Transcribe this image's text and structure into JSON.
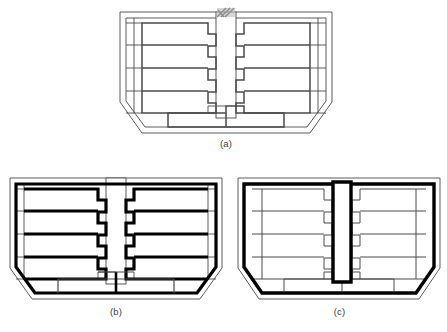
{
  "figure": {
    "kind": "architectural-floor-plan-diagram-set",
    "panel_count": 3,
    "background_color": "#ffffff",
    "line_color_thin": "#4a4a4a",
    "line_color_thick": "#000000",
    "accent_gray": "#9a9a9a",
    "fill_color": "#ffffff"
  },
  "panels": [
    {
      "id": "a",
      "caption": "(a)",
      "description": "Symmetric floor plan with chamfered octagonal outline, two wings of four stepped units flanking a central vertical corridor, lower block of units along the bottom, with a hatched marker at the top of the corridor.",
      "emphasis": "thin-outline",
      "unit_rows_left": 4,
      "unit_rows_right": 4,
      "bottom_units": 2,
      "has_hatch_marker": true,
      "corridor_style": "thin"
    },
    {
      "id": "b",
      "caption": "(b)",
      "description": "Same floor plan with the four left wing units and four right wing units outlined in heavy black, and the perimeter traced in heavy black.",
      "emphasis": "thick-units-and-perimeter",
      "unit_rows_left": 4,
      "unit_rows_right": 4,
      "bottom_units": 2,
      "has_hatch_marker": false,
      "corridor_style": "thin"
    },
    {
      "id": "c",
      "caption": "(c)",
      "description": "Same floor plan with only the outer perimeter and the central corridor outlined in heavy black; interior partition walls drawn thin.",
      "emphasis": "thick-perimeter-and-corridor",
      "unit_rows_left": 4,
      "unit_rows_right": 4,
      "bottom_units": 2,
      "has_hatch_marker": false,
      "corridor_style": "thick"
    }
  ],
  "captions": {
    "a": "(a)",
    "b": "(b)",
    "c": "(c)"
  }
}
